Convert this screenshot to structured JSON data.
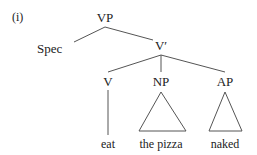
{
  "figure": {
    "example_label": "(i)",
    "background_color": "#ffffff",
    "line_color": "#555555",
    "text_color": "#222222"
  },
  "tree": {
    "nodes": [
      {
        "id": "vp",
        "label": "VP",
        "x": 105,
        "y": 17
      },
      {
        "id": "spec",
        "label": "Spec",
        "x": 55,
        "y": 48
      },
      {
        "id": "vbar",
        "label": "V′",
        "x": 161,
        "y": 45
      },
      {
        "id": "v",
        "label": "V",
        "x": 108,
        "y": 81
      },
      {
        "id": "np",
        "label": "NP",
        "x": 161,
        "y": 81
      },
      {
        "id": "ap",
        "label": "AP",
        "x": 225,
        "y": 81
      }
    ],
    "terminals": [
      {
        "id": "eat",
        "label": "eat",
        "x": 108,
        "y": 144
      },
      {
        "id": "the-pizza",
        "label": "the pizza",
        "x": 161,
        "y": 144
      },
      {
        "id": "naked",
        "label": "naked",
        "x": 225,
        "y": 144
      }
    ],
    "branches": [
      {
        "id": "vp-spec",
        "x1": 105,
        "y1": 27,
        "x2": 74,
        "y2": 42
      },
      {
        "id": "vp-vbar",
        "x1": 105,
        "y1": 27,
        "x2": 153,
        "y2": 40
      },
      {
        "id": "vbar-v",
        "x1": 161,
        "y1": 55,
        "x2": 108,
        "y2": 72
      },
      {
        "id": "vbar-np",
        "x1": 161,
        "y1": 55,
        "x2": 161,
        "y2": 72
      },
      {
        "id": "vbar-ap",
        "x1": 161,
        "y1": 55,
        "x2": 225,
        "y2": 72
      },
      {
        "id": "v-eat",
        "x1": 108,
        "y1": 90,
        "x2": 108,
        "y2": 135
      }
    ],
    "triangles": [
      {
        "id": "np-triangle",
        "apex_x": 161,
        "apex_y": 92,
        "left_x": 139,
        "right_x": 186,
        "base_y": 131
      },
      {
        "id": "ap-triangle",
        "apex_x": 225,
        "apex_y": 92,
        "left_x": 209,
        "right_x": 242,
        "base_y": 131
      }
    ]
  }
}
